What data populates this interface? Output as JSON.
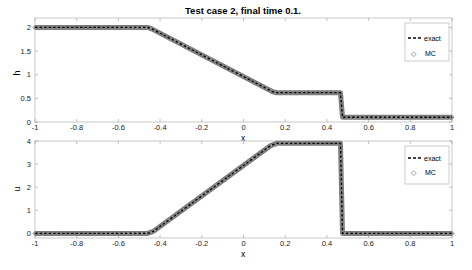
{
  "chart_data": [
    {
      "type": "line",
      "title": "Test case 2, final time 0.1.",
      "xlabel": "x",
      "ylabel": "h",
      "xlim": [
        -1,
        1
      ],
      "ylim": [
        0,
        2.2
      ],
      "xticks": [
        "-1",
        "-0.8",
        "-0.6",
        "-0.4",
        "-0.2",
        "0",
        "0.2",
        "0.4",
        "0.6",
        "0.8",
        "1"
      ],
      "yticks": [
        "0",
        "0.5",
        "1",
        "1.5",
        "2"
      ],
      "grid": false,
      "legend_position": "upper right",
      "series": [
        {
          "name": "exact",
          "style": "dashed",
          "x": [
            -1,
            -0.46,
            -0.44,
            0.14,
            0.16,
            0.465,
            0.475,
            1
          ],
          "y": [
            2,
            2,
            1.97,
            0.64,
            0.62,
            0.62,
            0.1,
            0.1
          ]
        },
        {
          "name": "MC",
          "style": "diamond-markers",
          "x": [
            -1,
            -0.46,
            -0.44,
            0.14,
            0.16,
            0.465,
            0.475,
            1
          ],
          "y": [
            2,
            2,
            1.97,
            0.64,
            0.62,
            0.62,
            0.1,
            0.1
          ]
        }
      ]
    },
    {
      "type": "line",
      "title": "",
      "xlabel": "x",
      "ylabel": "u",
      "xlim": [
        -1,
        1
      ],
      "ylim": [
        -0.1,
        4
      ],
      "xticks": [
        "-1",
        "-0.8",
        "-0.6",
        "-0.4",
        "-0.2",
        "0",
        "0.2",
        "0.4",
        "0.6",
        "0.8",
        "1"
      ],
      "yticks": [
        "0",
        "1",
        "2",
        "3",
        "4"
      ],
      "grid": false,
      "legend_position": "upper right",
      "series": [
        {
          "name": "exact",
          "style": "dashed",
          "x": [
            -1,
            -0.46,
            -0.43,
            0.13,
            0.16,
            0.465,
            0.475,
            1
          ],
          "y": [
            0,
            0,
            0.1,
            3.8,
            3.9,
            3.9,
            0,
            0
          ]
        },
        {
          "name": "MC",
          "style": "diamond-markers",
          "x": [
            -1,
            -0.46,
            -0.43,
            0.13,
            0.16,
            0.465,
            0.475,
            1
          ],
          "y": [
            0,
            0,
            0.1,
            3.8,
            3.9,
            3.9,
            0,
            0
          ]
        }
      ]
    }
  ],
  "title": "Test case 2, final time 0.1.",
  "top": {
    "ylabel": "h",
    "xlabel": "x",
    "yticks": [
      "2",
      "1.5",
      "1",
      "0.5",
      "0"
    ],
    "legend": {
      "exact": "exact",
      "mc": "MC"
    }
  },
  "bottom": {
    "ylabel": "u",
    "xlabel": "x",
    "yticks": [
      "4",
      "3",
      "2",
      "1",
      "0"
    ],
    "legend": {
      "exact": "exact",
      "mc": "MC"
    }
  },
  "xticks": [
    "-1",
    "-0.8",
    "-0.6",
    "-0.4",
    "-0.2",
    "0",
    "0.2",
    "0.4",
    "0.6",
    "0.8",
    "1"
  ],
  "colors": {
    "exact": "#000000",
    "mc": "#808080",
    "axis": "#999999"
  }
}
